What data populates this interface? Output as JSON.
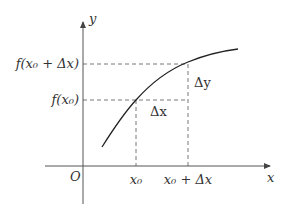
{
  "diagram": {
    "type": "derivative-increment-illustration",
    "axes": {
      "x_label": "x",
      "y_label": "y",
      "origin_label": "O"
    },
    "x_ticks": {
      "x0": "x₀",
      "x0_plus_dx": "x₀ + Δx"
    },
    "y_ticks": {
      "f_x0": "f(x₀)",
      "f_x0_plus_dx": "f(x₀ + Δx)"
    },
    "annotations": {
      "delta_x": "Δx",
      "delta_y": "Δy"
    },
    "colors": {
      "curve": "#222222",
      "axes": "#555555",
      "dashed": "#555555",
      "text": "#333333"
    }
  }
}
